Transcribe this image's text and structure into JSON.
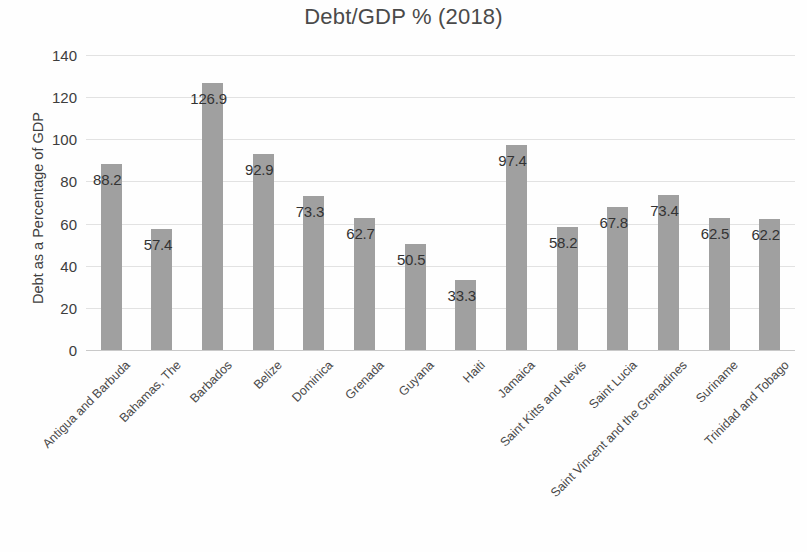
{
  "chart_data": {
    "type": "bar",
    "title": "Debt/GDP % (2018)",
    "xlabel": "",
    "ylabel": "Debt as a Percentage of GDP",
    "ylim": [
      0,
      140
    ],
    "ytick_step": 20,
    "yticks": [
      0,
      20,
      40,
      60,
      80,
      100,
      120,
      140
    ],
    "ytick_labels": [
      "0",
      "20",
      "40",
      "60",
      "80",
      "100",
      "120",
      "140"
    ],
    "grid": true,
    "legend": false,
    "bar_color": "#a0a0a0",
    "gridline_color": "#e2e2e2",
    "categories": [
      "Antigua and Barbuda",
      "Bahamas, The",
      "Barbados",
      "Belize",
      "Dominica",
      "Grenada",
      "Guyana",
      "Haiti",
      "Jamaica",
      "Saint Kitts and Nevis",
      "Saint Lucia",
      "Saint Vincent and the Grenadines",
      "Suriname",
      "Trinidad and Tobago"
    ],
    "values": [
      88.2,
      57.4,
      126.9,
      92.9,
      73.3,
      62.7,
      50.5,
      33.3,
      97.4,
      58.2,
      67.8,
      73.4,
      62.5,
      62.2
    ],
    "value_labels": [
      "88.2",
      "57.4",
      "126.9",
      "92.9",
      "73.3",
      "62.7",
      "50.5",
      "33.3",
      "97.4",
      "58.2",
      "67.8",
      "73.4",
      "62.5",
      "62.2"
    ]
  }
}
